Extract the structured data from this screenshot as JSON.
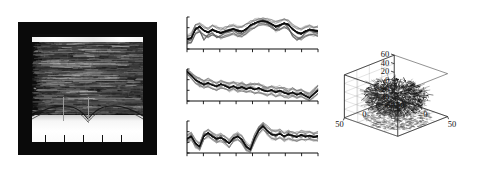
{
  "figure": {
    "title": "",
    "panel_count": 3,
    "background_color": "#ffffff",
    "trace_color": "#111111"
  },
  "panel_a": {
    "name": "spectrogram-panel",
    "description": "Dark spectrogram / waterfall image with bright horizontal band near top and bright lower region",
    "frame_color": "#0a0a0a",
    "bright_band_label": "",
    "axis_ticks": [
      "",
      "",
      "",
      "",
      ""
    ],
    "tick_count": 5,
    "vertical_marker_count": 2
  },
  "panel_b": {
    "name": "stacked-line-charts",
    "description": "Three stacked dense multi-trace line plots sharing an x axis style",
    "charts": [
      {
        "name": "mini-chart-1",
        "tick_count": 9,
        "baseline": ""
      },
      {
        "name": "mini-chart-2",
        "tick_count": 9,
        "baseline": ""
      },
      {
        "name": "mini-chart-3",
        "tick_count": 9,
        "baseline": ""
      }
    ]
  },
  "panel_c": {
    "name": "scatter3d-panel",
    "z_ticks": [
      "60",
      "40",
      "20",
      "0",
      "-20",
      "-40"
    ],
    "x_ticks": [
      "-50",
      "0",
      "50"
    ],
    "y_ticks": [
      "-50",
      "0",
      "50"
    ],
    "left_axis_labels": [
      "50",
      "0",
      "-50"
    ],
    "description": "Dense globular cloud of 3D trajectories inside a wireframe box with projected floor points"
  },
  "chart_data": [
    {
      "type": "line",
      "name": "mini-chart-1",
      "title": "",
      "xlabel": "",
      "ylabel": "",
      "grid": false,
      "legend": "none",
      "x": [
        0,
        1,
        2,
        3,
        4,
        5,
        6,
        7,
        8,
        9,
        10,
        11,
        12,
        13,
        14,
        15,
        16,
        17,
        18,
        19,
        20,
        21,
        22,
        23,
        24,
        25,
        26,
        27,
        28,
        29,
        30,
        31
      ],
      "xlim": [
        0,
        31
      ],
      "ylim": [
        0,
        1
      ],
      "series": [
        {
          "name": "trace-mean",
          "values": [
            0.3,
            0.34,
            0.62,
            0.7,
            0.58,
            0.52,
            0.6,
            0.55,
            0.5,
            0.54,
            0.58,
            0.62,
            0.57,
            0.55,
            0.62,
            0.74,
            0.8,
            0.86,
            0.88,
            0.85,
            0.78,
            0.7,
            0.74,
            0.8,
            0.76,
            0.62,
            0.52,
            0.48,
            0.55,
            0.6,
            0.58,
            0.56
          ]
        },
        {
          "name": "trace-band-upper",
          "values": [
            0.4,
            0.46,
            0.74,
            0.8,
            0.7,
            0.64,
            0.72,
            0.68,
            0.63,
            0.66,
            0.7,
            0.74,
            0.69,
            0.68,
            0.74,
            0.84,
            0.9,
            0.94,
            0.96,
            0.93,
            0.88,
            0.82,
            0.85,
            0.9,
            0.87,
            0.75,
            0.66,
            0.62,
            0.68,
            0.72,
            0.7,
            0.68
          ]
        },
        {
          "name": "trace-band-lower",
          "values": [
            0.18,
            0.22,
            0.48,
            0.56,
            0.44,
            0.38,
            0.46,
            0.4,
            0.34,
            0.4,
            0.44,
            0.48,
            0.42,
            0.4,
            0.48,
            0.6,
            0.68,
            0.76,
            0.78,
            0.74,
            0.66,
            0.56,
            0.6,
            0.68,
            0.62,
            0.46,
            0.36,
            0.32,
            0.4,
            0.46,
            0.44,
            0.42
          ]
        },
        {
          "name": "trace-outlier",
          "values": [
            0.22,
            0.3,
            0.66,
            0.58,
            0.3,
            0.44,
            0.52,
            0.36,
            0.42,
            0.5,
            0.54,
            0.58,
            0.5,
            0.46,
            0.56,
            0.7,
            0.78,
            0.84,
            0.9,
            0.8,
            0.7,
            0.62,
            0.7,
            0.78,
            0.66,
            0.4,
            0.28,
            0.36,
            0.5,
            0.58,
            0.52,
            0.5
          ]
        }
      ]
    },
    {
      "type": "line",
      "name": "mini-chart-2",
      "title": "",
      "xlabel": "",
      "ylabel": "",
      "grid": false,
      "legend": "none",
      "x": [
        0,
        1,
        2,
        3,
        4,
        5,
        6,
        7,
        8,
        9,
        10,
        11,
        12,
        13,
        14,
        15,
        16,
        17,
        18,
        19,
        20,
        21,
        22,
        23,
        24,
        25,
        26,
        27,
        28,
        29,
        30,
        31
      ],
      "xlim": [
        0,
        31
      ],
      "ylim": [
        0,
        1
      ],
      "series": [
        {
          "name": "trace-mean",
          "values": [
            0.92,
            0.8,
            0.66,
            0.58,
            0.52,
            0.56,
            0.5,
            0.46,
            0.52,
            0.48,
            0.42,
            0.46,
            0.4,
            0.44,
            0.38,
            0.42,
            0.36,
            0.4,
            0.34,
            0.3,
            0.34,
            0.28,
            0.32,
            0.26,
            0.22,
            0.26,
            0.2,
            0.24,
            0.16,
            0.1,
            0.22,
            0.34
          ]
        },
        {
          "name": "trace-band-upper",
          "values": [
            0.98,
            0.88,
            0.76,
            0.68,
            0.62,
            0.66,
            0.6,
            0.56,
            0.62,
            0.58,
            0.54,
            0.58,
            0.52,
            0.56,
            0.5,
            0.56,
            0.5,
            0.54,
            0.46,
            0.42,
            0.46,
            0.4,
            0.44,
            0.38,
            0.34,
            0.38,
            0.32,
            0.36,
            0.28,
            0.22,
            0.34,
            0.46
          ]
        },
        {
          "name": "trace-band-lower",
          "values": [
            0.86,
            0.72,
            0.56,
            0.48,
            0.42,
            0.46,
            0.4,
            0.36,
            0.42,
            0.38,
            0.32,
            0.36,
            0.3,
            0.34,
            0.28,
            0.3,
            0.24,
            0.28,
            0.22,
            0.18,
            0.22,
            0.16,
            0.2,
            0.14,
            0.12,
            0.16,
            0.1,
            0.14,
            0.08,
            0.04,
            0.12,
            0.24
          ]
        },
        {
          "name": "trace-outlier",
          "values": [
            0.9,
            0.76,
            0.7,
            0.5,
            0.58,
            0.5,
            0.56,
            0.42,
            0.48,
            0.54,
            0.46,
            0.4,
            0.46,
            0.5,
            0.44,
            0.48,
            0.42,
            0.34,
            0.4,
            0.36,
            0.28,
            0.34,
            0.26,
            0.32,
            0.28,
            0.2,
            0.26,
            0.18,
            0.22,
            0.14,
            0.28,
            0.4
          ]
        }
      ]
    },
    {
      "type": "line",
      "name": "mini-chart-3",
      "title": "",
      "xlabel": "",
      "ylabel": "",
      "grid": false,
      "legend": "none",
      "x": [
        0,
        1,
        2,
        3,
        4,
        5,
        6,
        7,
        8,
        9,
        10,
        11,
        12,
        13,
        14,
        15,
        16,
        17,
        18,
        19,
        20,
        21,
        22,
        23,
        24,
        25,
        26,
        27,
        28,
        29,
        30,
        31
      ],
      "xlim": [
        0,
        31
      ],
      "ylim": [
        0,
        1
      ],
      "series": [
        {
          "name": "trace-mean",
          "values": [
            0.44,
            0.52,
            0.3,
            0.2,
            0.54,
            0.62,
            0.52,
            0.44,
            0.48,
            0.4,
            0.3,
            0.46,
            0.52,
            0.42,
            0.2,
            0.1,
            0.46,
            0.72,
            0.84,
            0.7,
            0.58,
            0.56,
            0.6,
            0.52,
            0.58,
            0.54,
            0.5,
            0.56,
            0.52,
            0.54,
            0.5,
            0.52
          ]
        },
        {
          "name": "trace-band-upper",
          "values": [
            0.54,
            0.62,
            0.4,
            0.3,
            0.64,
            0.72,
            0.62,
            0.54,
            0.58,
            0.5,
            0.4,
            0.56,
            0.62,
            0.52,
            0.3,
            0.2,
            0.58,
            0.84,
            0.94,
            0.82,
            0.7,
            0.68,
            0.72,
            0.64,
            0.7,
            0.66,
            0.62,
            0.68,
            0.64,
            0.66,
            0.62,
            0.64
          ]
        },
        {
          "name": "trace-band-lower",
          "values": [
            0.34,
            0.42,
            0.2,
            0.1,
            0.44,
            0.52,
            0.42,
            0.34,
            0.38,
            0.3,
            0.2,
            0.36,
            0.42,
            0.32,
            0.1,
            0.04,
            0.34,
            0.6,
            0.74,
            0.58,
            0.46,
            0.44,
            0.48,
            0.4,
            0.46,
            0.42,
            0.38,
            0.44,
            0.4,
            0.42,
            0.38,
            0.4
          ]
        },
        {
          "name": "trace-outlier",
          "values": [
            0.4,
            0.58,
            0.26,
            0.14,
            0.6,
            0.56,
            0.58,
            0.38,
            0.54,
            0.34,
            0.36,
            0.4,
            0.58,
            0.36,
            0.14,
            0.16,
            0.4,
            0.78,
            0.9,
            0.64,
            0.64,
            0.5,
            0.66,
            0.46,
            0.64,
            0.48,
            0.56,
            0.5,
            0.58,
            0.48,
            0.56,
            0.46
          ]
        }
      ]
    },
    {
      "type": "scatter",
      "name": "scatter3d",
      "title": "",
      "xlabel": "",
      "ylabel": "",
      "zlabel": "",
      "grid": true,
      "legend": "none",
      "xlim": [
        -50,
        50
      ],
      "ylim": [
        -50,
        50
      ],
      "zlim": [
        -40,
        60
      ],
      "xticks": [
        -50,
        0,
        50
      ],
      "yticks": [
        -50,
        0,
        50
      ],
      "zticks": [
        -40,
        -20,
        0,
        20,
        40,
        60
      ],
      "projection": "3d",
      "description": "Dense globular cloud of overlapping 3D trajectories centred near origin, radius approx 45 units, with scattered projection points on the floor plane"
    }
  ]
}
